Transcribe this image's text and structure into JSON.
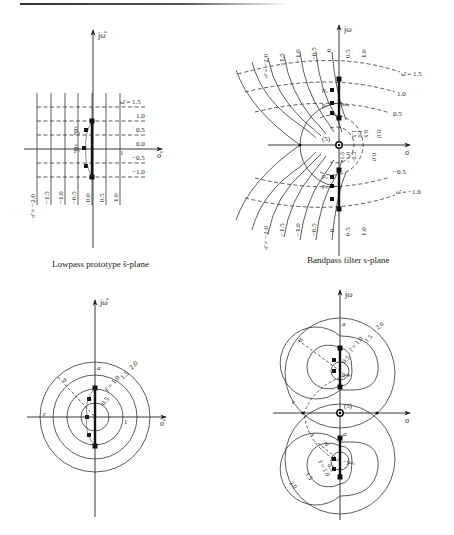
{
  "page": {
    "background": "#ffffff",
    "ink_color": "#222222"
  },
  "panels": {
    "lowpass_grid": {
      "caption": "Lowpass prototype ŝ-plane",
      "axis_imag_label": "jω̂",
      "axis_real_label": "σ̂",
      "unit_tick_label": "1",
      "pole_labels": [
        "p̂₂",
        "p̂₁"
      ],
      "omega_labels": [
        "ω̂ = 1.5",
        "1.0",
        "0.5",
        "0.0",
        "−0.5",
        "−1.0"
      ],
      "sigma_labels": [
        "σ̂ = −2.0",
        "−1.5",
        "−1.0",
        "−0.5",
        "0.0",
        "0.5",
        "1.0"
      ]
    },
    "bandpass_grid": {
      "caption": "Bandpass filter s-plane",
      "axis_imag_label": "jω",
      "axis_real_label": "σ",
      "origin_zero_label": "(5)",
      "center_freq_label": "jω₀",
      "pole_labels_upper": [
        "p₂",
        "p₁"
      ],
      "pole_labels_lower": [
        "p₂",
        "p₁"
      ],
      "omega_labels_upper": [
        "ω̂ = 1.5",
        "1.0",
        "0.5",
        "0.0"
      ],
      "omega_labels_lower": [
        "0.0",
        "−0.5",
        "ω̂ = −1.0"
      ],
      "sigma_labels_top": [
        "σ̂ = −2.0",
        "−1.5",
        "−1.0",
        "−0.5",
        "0",
        "0.5",
        "1.0"
      ],
      "sigma_labels_bottom": [
        "σ̂ = −2.0",
        "−1.5",
        "−1.0",
        "−0.5",
        "0",
        "0.5",
        "1.0"
      ],
      "inner_labels_upper": [
        "1.5",
        "1.0",
        "0.5"
      ],
      "inner_labels_lower": [
        "−1.5",
        "−1.0",
        "−0.5"
      ]
    },
    "lowpass_circles": {
      "axis_imag_label": "jω̂",
      "axis_real_label": "σ̂",
      "unit_tick_label": "1",
      "radius_labels": [
        "0.5",
        "r̂ = 1.0",
        "1.5",
        "2.0"
      ],
      "point_labels": [
        "a",
        "b",
        "c"
      ]
    },
    "bandpass_circles": {
      "axis_imag_label": "jω",
      "axis_real_label": "σ",
      "origin_zero_label": "(5)",
      "upper_center_label": "jω₀",
      "lower_center_label": "−jω₀",
      "radius_labels_upper": [
        "0.5",
        "r̂ = 1.0",
        "1.5",
        "2.0"
      ],
      "radius_labels_lower": [
        "0.5",
        "r̂ = 1.0",
        "1.5",
        "2.0"
      ],
      "point_labels_upper": [
        "a",
        "b",
        "c"
      ],
      "point_labels_lower": [
        "a",
        "b",
        "c"
      ]
    }
  }
}
